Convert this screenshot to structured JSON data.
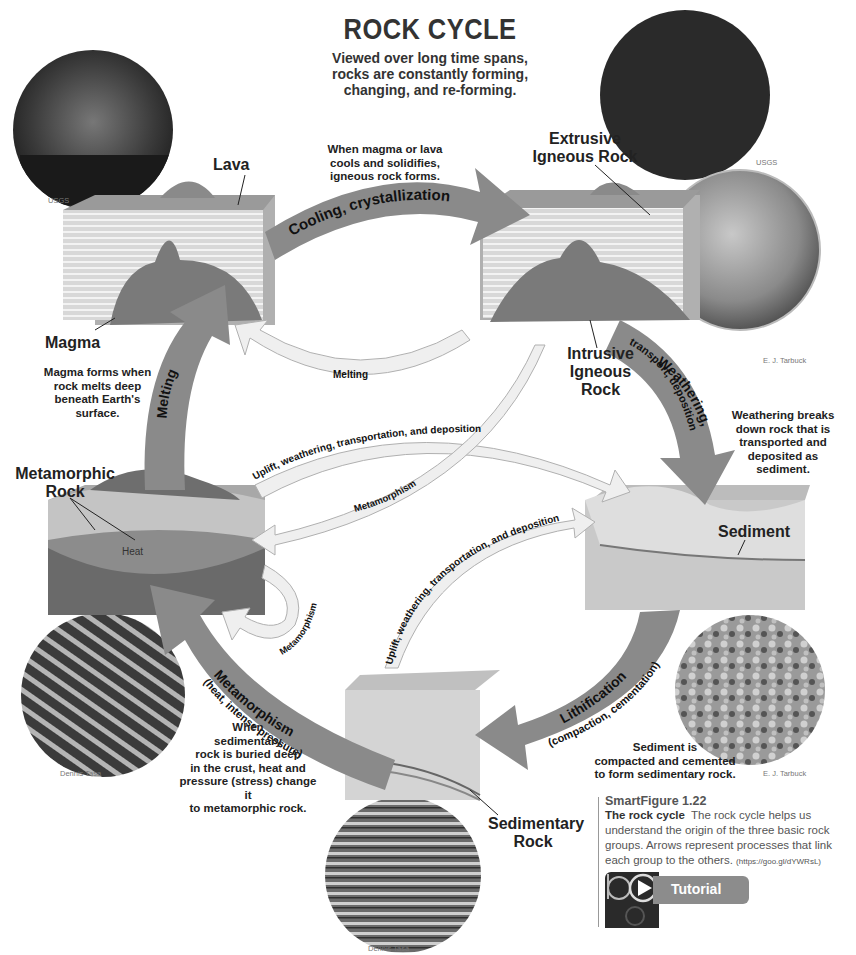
{
  "header": {
    "title": "ROCK CYCLE",
    "subtitle_lines": [
      "Viewed over long time spans,",
      "rocks are constantly forming,",
      "changing, and re-forming."
    ]
  },
  "rock_groups": {
    "igneous_extrusive": "Extrusive Igneous Rock",
    "igneous_intrusive": "Intrusive Igneous Rock",
    "sedimentary": "Sedimentary Rock",
    "metamorphic": "Metamorphic Rock"
  },
  "labels": {
    "lava": "Lava",
    "magma": "Magma",
    "extrusive_l1": "Extrusive",
    "extrusive_l2": "Igneous Rock",
    "intrusive_l1": "Intrusive",
    "intrusive_l2": "Igneous",
    "intrusive_l3": "Rock",
    "metamorphic_l1": "Metamorphic",
    "metamorphic_l2": "Rock",
    "sediment": "Sediment",
    "sedimentary_l1": "Sedimentary",
    "sedimentary_l2": "Rock",
    "heat": "Heat"
  },
  "notes": {
    "cooling": [
      "When magma or lava",
      "cools and solidifies,",
      "igneous rock forms."
    ],
    "magma": [
      "Magma forms when",
      "rock melts deep",
      "beneath Earth's",
      "surface."
    ],
    "weathering": [
      "Weathering breaks",
      "down rock that is",
      "transported and",
      "deposited as",
      "sediment."
    ],
    "lithification": [
      "Sediment is",
      "compacted and cemented",
      "to form sedimentary rock."
    ],
    "metamorphism": [
      "When",
      "sedimentary",
      "rock is buried deep",
      "in the crust, heat and",
      "pressure (stress) change it",
      "to metamorphic rock."
    ]
  },
  "arrows": {
    "cooling": "Cooling, crystallization",
    "melting_main": "Melting",
    "melting_return": "Melting",
    "weathering_l1": "Weathering,",
    "weathering_l2": "transport, deposition",
    "lithification_l1": "Lithification",
    "lithification_l2": "(compaction, cementation)",
    "metamorphism_l1": "Metamorphism",
    "metamorphism_l2": "(heat, intense pressure)",
    "uplift_upper": "Uplift, weathering, transportation, and deposition",
    "uplift_lower": "Uplift, weathering, transportation, and deposition",
    "metamorphism_thin": "Metamorphism",
    "metamorphism_loop": "Metamorphism"
  },
  "credits": {
    "lava_photo": "USGS",
    "extrusive_photo": "USGS",
    "granite_photo": "E. J. Tarbuck",
    "sandstone_photo": "E. J. Tarbuck",
    "gneiss_photo": "Dennis Tasa",
    "canyon_photo": "Dennis Tasa"
  },
  "caption": {
    "figure_number": "SmartFigure 1.22",
    "title": "The rock cycle",
    "body": "The rock cycle helps us understand the origin of the three basic rock groups. Arrows represent processes that link each group to the others.",
    "url": "(https://goo.gl/dYWRsL)"
  },
  "tutorial": {
    "label": "Tutorial"
  },
  "colors": {
    "arrow_main": "#8a8a8a",
    "arrow_light": "#e6e6e6",
    "text_dark": "#222222"
  }
}
